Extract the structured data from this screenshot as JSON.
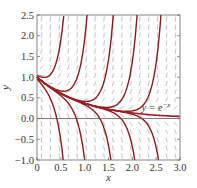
{
  "chart_data": {
    "type": "line",
    "title": "",
    "xlabel": "x",
    "ylabel": "y",
    "xlim": [
      0,
      3.0
    ],
    "ylim": [
      -1.0,
      2.5
    ],
    "xticks": [
      "0",
      "0.5",
      "1.0",
      "1.5",
      "2.0",
      "2.5",
      "3.0"
    ],
    "yticks": [
      "-1.0",
      "-0.5",
      "0.0",
      "0.5",
      "1.0",
      "1.5",
      "2.0",
      "2.5"
    ],
    "grid": false,
    "slope_field": true,
    "annotation": {
      "text": "y = e",
      "sup": "-x",
      "x": 2.2,
      "y": 0.18
    },
    "reference_curve": {
      "name": "y = e^{-x}",
      "formula": "exp(-x)"
    },
    "growth_rate_k": 6.5,
    "solution_family": "y = e^{-x} + C e^{k x}",
    "upward_curves_cross_top_at_x": [
      0.55,
      1.05,
      1.6,
      2.1,
      2.6
    ],
    "downward_curves_cross_bottom_at_x": [
      0.55,
      1.0,
      1.55,
      2.05,
      2.55
    ],
    "first_curve_start": {
      "x": 0,
      "y": 1.05
    },
    "colors": {
      "curve": "#8b1a1a",
      "reference": "#a0202a",
      "slope": "#999999",
      "axis": "#555555"
    }
  }
}
